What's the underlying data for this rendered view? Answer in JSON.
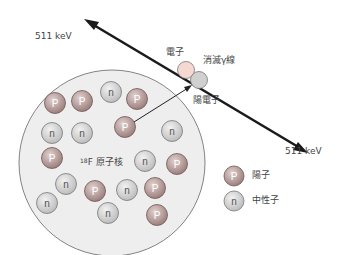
{
  "diagram": {
    "energy_label_top": "511 keV",
    "energy_label_bottom": "511 keV",
    "electron_label": "電子",
    "annihilation_label": "消滅γ線",
    "positron_label": "陽電子",
    "nucleus_label_sup": "18",
    "nucleus_label": "F 原子核",
    "proton_symbol": "P",
    "neutron_symbol": "n"
  },
  "legend": {
    "items": [
      {
        "symbol": "P",
        "label": "陽子"
      },
      {
        "symbol": "n",
        "label": "中性子"
      }
    ]
  },
  "colors": {
    "proton_fill": "#b59a98",
    "neutron_fill": "#d6d6d6",
    "electron_fill": "#f6d8d2",
    "positron_fill": "#d0d0d0",
    "nucleus_fill": "#eeeeee",
    "line": "#1a1a1a"
  },
  "particles": [
    {
      "type": "P",
      "x": 55,
      "y": 103
    },
    {
      "type": "P",
      "x": 82,
      "y": 101
    },
    {
      "type": "n",
      "x": 111,
      "y": 92
    },
    {
      "type": "P",
      "x": 137,
      "y": 99
    },
    {
      "type": "n",
      "x": 52,
      "y": 133
    },
    {
      "type": "n",
      "x": 82,
      "y": 133
    },
    {
      "type": "P",
      "x": 125,
      "y": 127
    },
    {
      "type": "n",
      "x": 172,
      "y": 131
    },
    {
      "type": "P",
      "x": 52,
      "y": 158
    },
    {
      "type": "n",
      "x": 145,
      "y": 161
    },
    {
      "type": "P",
      "x": 177,
      "y": 164
    },
    {
      "type": "n",
      "x": 66,
      "y": 184
    },
    {
      "type": "P",
      "x": 95,
      "y": 191
    },
    {
      "type": "n",
      "x": 127,
      "y": 190
    },
    {
      "type": "P",
      "x": 155,
      "y": 188
    },
    {
      "type": "n",
      "x": 47,
      "y": 203
    },
    {
      "type": "n",
      "x": 108,
      "y": 213
    },
    {
      "type": "P",
      "x": 157,
      "y": 215
    }
  ]
}
